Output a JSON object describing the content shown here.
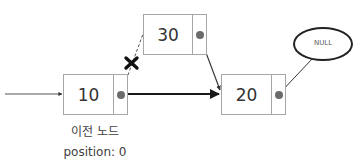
{
  "diagram": {
    "type": "linked-list-insertion",
    "nodes": [
      {
        "id": "node-10",
        "value": "10"
      },
      {
        "id": "node-30",
        "value": "30"
      },
      {
        "id": "node-20",
        "value": "20"
      }
    ],
    "null_label": "NULL",
    "prev_node_label": "이전 노드",
    "position_label": "position: 0",
    "colors": {
      "box_border": "#a6a6a6",
      "text": "#333333",
      "pointer_dot": "#6b6b6b",
      "arrow": "#1a1a1a",
      "x_mark": "#111111"
    }
  }
}
